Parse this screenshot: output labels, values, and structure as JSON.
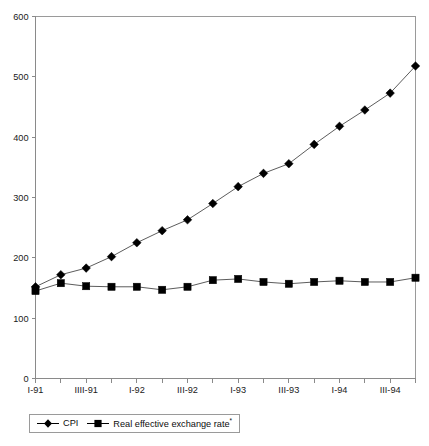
{
  "chart_data": {
    "type": "line",
    "title": "",
    "xlabel": "",
    "ylabel": "",
    "ylim": [
      0,
      600
    ],
    "yticks": [
      0,
      100,
      200,
      300,
      400,
      500,
      600
    ],
    "grid": false,
    "legend_position": "bottom-left",
    "categories": [
      "I-91",
      "II-91",
      "IIII-91",
      "IV-91",
      "I-92",
      "II-92",
      "III-92",
      "IV-92",
      "I-93",
      "II-93",
      "III-93",
      "IV-93",
      "I-94",
      "II-94",
      "III-94",
      "IV-94"
    ],
    "xtick_labels": [
      "I-91",
      "IIII-91",
      "I-92",
      "III-92",
      "I-93",
      "III-93",
      "I-94",
      "III-94"
    ],
    "xtick_label_indices": [
      0,
      2,
      4,
      6,
      8,
      10,
      12,
      14
    ],
    "series": [
      {
        "name": "CPI",
        "marker": "diamond",
        "color": "#000000",
        "values": [
          152,
          172,
          183,
          202,
          225,
          245,
          263,
          290,
          318,
          340,
          356,
          388,
          418,
          445,
          473,
          518
        ]
      },
      {
        "name": "Real effective exchange rate*",
        "marker": "square",
        "color": "#000000",
        "values": [
          145,
          158,
          153,
          152,
          152,
          147,
          152,
          163,
          165,
          160,
          157,
          160,
          162,
          160,
          160,
          167
        ]
      }
    ]
  },
  "legend": {
    "items": [
      {
        "label": "CPI",
        "sup": "",
        "marker": "diamond"
      },
      {
        "label": "Real effective exchange rate",
        "sup": "*",
        "marker": "square"
      }
    ]
  },
  "axes": {
    "y_tick_labels": [
      "600",
      "500",
      "400",
      "300",
      "200",
      "100",
      "0"
    ],
    "x_tick_labels": [
      "I-91",
      "IIII-91",
      "I-92",
      "III-92",
      "I-93",
      "III-93",
      "I-94",
      "III-94"
    ]
  }
}
